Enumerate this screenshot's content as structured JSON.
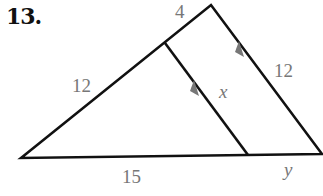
{
  "problem": {
    "number": "13."
  },
  "diagram": {
    "colors": {
      "line": "#111111",
      "label": "#777777",
      "arrow": "#777777"
    },
    "vertices": {
      "left": [
        21,
        158
      ],
      "apex": [
        211,
        5
      ],
      "right": [
        322,
        154
      ],
      "inner_top": [
        165,
        43
      ],
      "inner_bottom": [
        248,
        155
      ]
    },
    "labels": {
      "top_segment": "4",
      "left_side": "12",
      "right_side": "12",
      "inner_segment": "x",
      "base_left": "15",
      "base_right": "y"
    },
    "parallel_marks": [
      "inner-segment",
      "right-side"
    ]
  }
}
